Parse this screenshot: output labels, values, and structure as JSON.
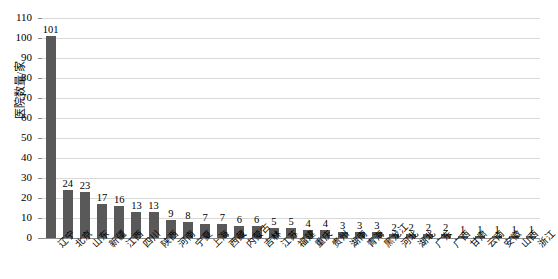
{
  "chart_data": {
    "type": "bar",
    "title": "",
    "xlabel": "",
    "ylabel": "医院数量/家",
    "ylim": [
      0,
      110
    ],
    "ytick_step": 10,
    "yticks": [
      "0",
      "10",
      "20",
      "30",
      "40",
      "50",
      "60",
      "70",
      "80",
      "90",
      "100",
      "110"
    ],
    "grid": true,
    "legend": "none",
    "bar_color": "#595959",
    "grid_color": "#D9D9D9",
    "axis_color": "#8C8C8C",
    "categories": [
      "辽宁",
      "北京",
      "山东",
      "新疆",
      "江西",
      "四川",
      "陕西",
      "河南",
      "宁夏",
      "上海",
      "西藏",
      "内蒙古",
      "吉林",
      "江苏",
      "福建",
      "重庆",
      "贵州",
      "湖南",
      "青海",
      "黑龙江",
      "河北",
      "湖北",
      "广东",
      "广西",
      "甘肃",
      "云南",
      "安徽",
      "山西",
      "浙江"
    ],
    "values": [
      101,
      24,
      23,
      17,
      16,
      13,
      13,
      9,
      8,
      7,
      7,
      6,
      6,
      5,
      5,
      4,
      4,
      3,
      3,
      3,
      2,
      2,
      2,
      2,
      1,
      1,
      1,
      1,
      1
    ],
    "value_labels": [
      "101",
      "24",
      "23",
      "17",
      "16",
      "13",
      "13",
      "9",
      "8",
      "7",
      "7",
      "6",
      "6",
      "5",
      "5",
      "4",
      "4",
      "3",
      "3",
      "3",
      "2",
      "2",
      "2",
      "2",
      "1",
      "1",
      "1",
      "1",
      "1"
    ]
  }
}
